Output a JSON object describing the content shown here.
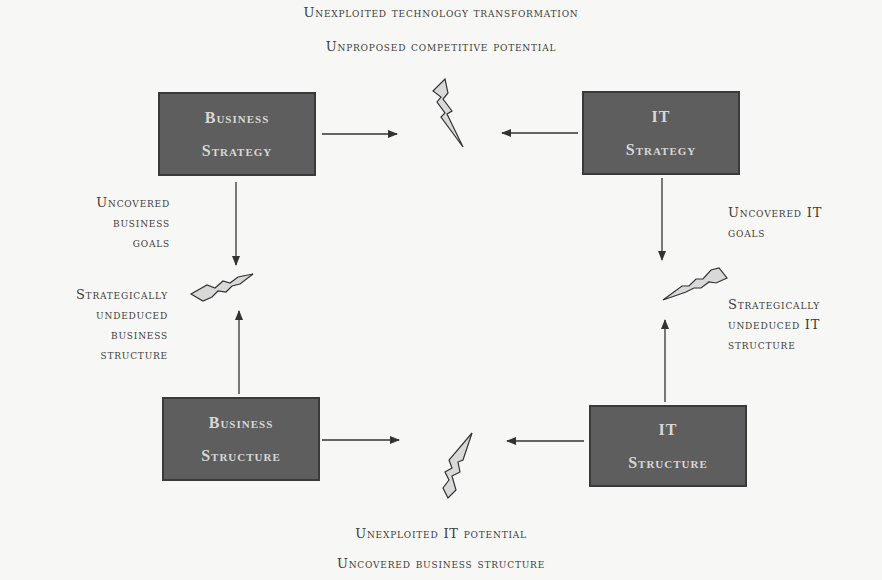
{
  "top_labels": {
    "line1": "Unexploited technology transformation",
    "line2": "Unproposed competitive potential"
  },
  "bottom_labels": {
    "line1": "Unexploited IT potential",
    "line2": "Uncovered business structure"
  },
  "boxes": {
    "business_strategy": {
      "line1": "Business",
      "line2": "Strategy"
    },
    "it_strategy": {
      "line1": "IT",
      "line2": "Strategy"
    },
    "business_structure": {
      "line1": "Business",
      "line2": "Structure"
    },
    "it_structure": {
      "line1": "IT",
      "line2": "Structure"
    }
  },
  "left_labels": {
    "uncovered": [
      "Uncovered",
      "business",
      "goals"
    ],
    "undeduced": [
      "Strategically",
      "undeduced",
      "business",
      "structure"
    ]
  },
  "right_labels": {
    "uncovered": [
      "Uncovered IT",
      "goals"
    ],
    "undeduced": [
      "Strategically",
      "undeduced IT",
      "structure"
    ]
  },
  "colors": {
    "box_fill": "#5e5e5e",
    "box_text": "#d8d8d8",
    "bolt_fill": "#d9d9d9",
    "line": "#333333"
  }
}
